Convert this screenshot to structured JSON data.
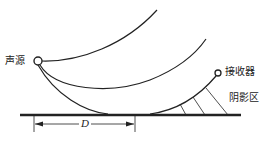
{
  "diagram": {
    "labels": {
      "source": "声源",
      "receiver": "接收器",
      "shadow_zone": "阴影区",
      "distance": "D"
    },
    "colors": {
      "line": "#222222",
      "background": "#ffffff"
    }
  }
}
